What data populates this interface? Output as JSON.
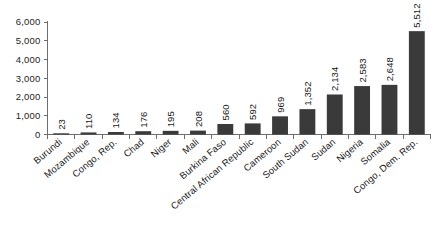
{
  "chart_data": {
    "type": "bar",
    "title": "",
    "subtitle": "",
    "xlabel": "",
    "ylabel": "",
    "ylim": [
      0,
      6000
    ],
    "ytick_labels": [
      "0",
      "1,000",
      "2,000",
      "3,000",
      "4,000",
      "5,000",
      "6,000"
    ],
    "ytick_values": [
      0,
      1000,
      2000,
      3000,
      4000,
      5000,
      6000
    ],
    "grid": false,
    "legend": null,
    "orientation": "vertical",
    "bar_color": "#3a3a3a",
    "axis_color": "#6d6d6d",
    "background": "#ffffff",
    "value_label_rotation": -90,
    "category_label_rotation": -40,
    "categories": [
      "Burundi",
      "Mozambique",
      "Congo, Rep.",
      "Chad",
      "Niger",
      "Mali",
      "Burkina Faso",
      "Central African Republic",
      "Cameroon",
      "South Sudan",
      "Sudan",
      "Nigeria",
      "Somalia",
      "Congo, Dem. Rep."
    ],
    "values": [
      23,
      110,
      134,
      176,
      195,
      208,
      560,
      592,
      969,
      1352,
      2134,
      2583,
      2648,
      5512
    ],
    "value_labels": [
      "23",
      "110",
      "134",
      "176",
      "195",
      "208",
      "560",
      "592",
      "969",
      "1,352",
      "2,134",
      "2,583",
      "2,648",
      "5,512"
    ]
  }
}
